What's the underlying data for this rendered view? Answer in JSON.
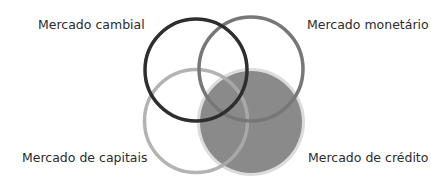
{
  "diagram": {
    "type": "venn",
    "labels": {
      "top_left": "Mercado cambial",
      "top_right": "Mercado monetário",
      "bottom_left": "Mercado de capitais",
      "bottom_right": "Mercado de crédito"
    },
    "circles": [
      {
        "name": "Mercado cambial",
        "cx": 196,
        "cy": 70,
        "r": 51,
        "style": "outline",
        "stroke": "#2e2e2e"
      },
      {
        "name": "Mercado monetário",
        "cx": 251,
        "cy": 69,
        "r": 52,
        "style": "outline",
        "stroke": "#7a7a7a"
      },
      {
        "name": "Mercado de capitais",
        "cx": 196,
        "cy": 121,
        "r": 52,
        "style": "outline",
        "stroke": "#a8a8a8"
      },
      {
        "name": "Mercado de crédito",
        "cx": 251,
        "cy": 122,
        "r": 52,
        "style": "filled",
        "fill": "#8a8a8a",
        "halo": "#d9d9d9"
      }
    ]
  }
}
